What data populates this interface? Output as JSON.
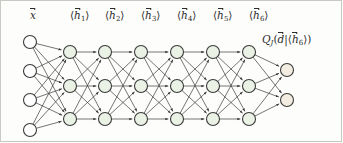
{
  "figure": {
    "background_color": "#fdfdfb",
    "frame_color": "#c9c9c4"
  },
  "labels": {
    "input": {
      "symbol": "x",
      "accent": "vector-arrow",
      "x": 30,
      "y": 10
    },
    "hidden": [
      {
        "symbol": "h",
        "subscript": "1",
        "accent": "vector-arrow",
        "bracket": "angle",
        "x": 70,
        "y": 10
      },
      {
        "symbol": "h",
        "subscript": "2",
        "accent": "vector-arrow",
        "bracket": "angle",
        "x": 105,
        "y": 10
      },
      {
        "symbol": "h",
        "subscript": "3",
        "accent": "vector-arrow",
        "bracket": "angle",
        "x": 141,
        "y": 10
      },
      {
        "symbol": "h",
        "subscript": "4",
        "accent": "vector-arrow",
        "bracket": "angle",
        "x": 177,
        "y": 10
      },
      {
        "symbol": "h",
        "subscript": "5",
        "accent": "vector-arrow",
        "bracket": "angle",
        "x": 213,
        "y": 10
      },
      {
        "symbol": "h",
        "subscript": "6",
        "accent": "vector-arrow",
        "bracket": "angle",
        "x": 249,
        "y": 10
      }
    ],
    "output": {
      "q_symbol": "Q",
      "q_subscript": "J",
      "d_symbol": "d",
      "h_symbol": "h",
      "h_subscript": "6",
      "x": 262,
      "y": 34
    }
  },
  "chart_data": {
    "type": "diagram",
    "diagram_kind": "neural-network",
    "node_radius": 6.5,
    "layers": [
      {
        "name": "input",
        "label": "x",
        "node_count": 4,
        "fill": "#ffffff",
        "stroke": "#3a3a3a",
        "x": 30,
        "node_y": [
          42,
          71,
          100,
          130
        ]
      },
      {
        "name": "hidden-1",
        "label": "h1",
        "node_count": 3,
        "fill": "#eaf2e6",
        "stroke": "#3a3a3a",
        "x": 70,
        "node_y": [
          52,
          86,
          119
        ]
      },
      {
        "name": "hidden-2",
        "label": "h2",
        "node_count": 3,
        "fill": "#eaf2e6",
        "stroke": "#3a3a3a",
        "x": 105,
        "node_y": [
          52,
          86,
          119
        ]
      },
      {
        "name": "hidden-3",
        "label": "h3",
        "node_count": 3,
        "fill": "#eaf2e6",
        "stroke": "#3a3a3a",
        "x": 141,
        "node_y": [
          52,
          86,
          119
        ]
      },
      {
        "name": "hidden-4",
        "label": "h4",
        "node_count": 3,
        "fill": "#eaf2e6",
        "stroke": "#3a3a3a",
        "x": 177,
        "node_y": [
          52,
          86,
          119
        ]
      },
      {
        "name": "hidden-5",
        "label": "h5",
        "node_count": 3,
        "fill": "#eaf2e6",
        "stroke": "#3a3a3a",
        "x": 213,
        "node_y": [
          52,
          86,
          119
        ]
      },
      {
        "name": "hidden-6",
        "label": "h6",
        "node_count": 3,
        "fill": "#eaf2e6",
        "stroke": "#3a3a3a",
        "x": 249,
        "node_y": [
          52,
          86,
          119
        ]
      },
      {
        "name": "output",
        "label": "Q",
        "node_count": 2,
        "fill": "#f3ede1",
        "stroke": "#3a3a3a",
        "x": 287,
        "node_y": [
          70,
          100
        ]
      }
    ],
    "edge_style": {
      "type": "directed",
      "color": "#3a3a3a",
      "width": 0.7,
      "arrowheads": true,
      "connectivity": "fully-connected-between-adjacent-layers"
    }
  }
}
